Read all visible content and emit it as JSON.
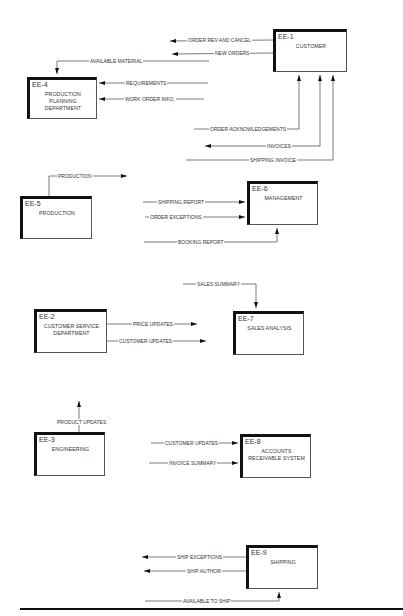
{
  "entities": [
    {
      "id": "EE-1",
      "name": "CUSTOMER"
    },
    {
      "id": "EE-2",
      "name": "CUSTOMER SERVICE DEPARTMENT"
    },
    {
      "id": "EE-3",
      "name": "ENGINEERING"
    },
    {
      "id": "EE-4",
      "name": "PRODUCTION PLANNING DEPARTMENT"
    },
    {
      "id": "EE-5",
      "name": "PRODUCTION"
    },
    {
      "id": "EE-6",
      "name": "MANAGEMENT"
    },
    {
      "id": "EE-7",
      "name": "SALES ANALYSIS"
    },
    {
      "id": "EE-8",
      "name": "ACCOUNTS RECEIVABLE SYSTEM"
    },
    {
      "id": "EE-9",
      "name": "SHIPPING"
    }
  ],
  "boxes": {
    "ee1": {
      "id": "EE-1",
      "line1": "CUSTOMER"
    },
    "ee4": {
      "id": "EE-4",
      "line1": "PRODUCTION",
      "line2": "PLANNING",
      "line3": "DEPARTMENT"
    },
    "ee5": {
      "id": "EE-5",
      "line1": "PRODUCTION"
    },
    "ee6": {
      "id": "EE-6",
      "line1": "MANAGEMENT"
    },
    "ee2": {
      "id": "EE-2",
      "line1": "CUSTOMER SERVICE",
      "line2": "DEPARTMENT"
    },
    "ee7": {
      "id": "EE-7",
      "line1": "SALES ANALYSIS"
    },
    "ee3": {
      "id": "EE-3",
      "line1": "ENGINEERING"
    },
    "ee8": {
      "id": "EE-8",
      "line1": "ACCOUNTS",
      "line2": "RECEIVABLE SYSTEM"
    },
    "ee9": {
      "id": "EE-9",
      "line1": "SHIPPING"
    }
  },
  "flows": {
    "order_rev_cancel": "ORDER REV AND CANCEL",
    "new_orders": "NEW ORDERS",
    "available_material": "AVAILABLE MATERIAL",
    "requirements": "REQUIREMENTS",
    "work_order_info": "WORK ORDER INFO.",
    "order_ack": "ORDER ACKNOWLEDGEMENTS",
    "invoices": "INVOICES",
    "shipping_invoice": "SHIPPING INVOICE",
    "production": "PRODUCTION",
    "shipping_report": "SHIPPING REPORT",
    "order_exceptions": "ORDER EXCEPTIONS",
    "booking_report": "BOOKING REPORT",
    "sales_summary": "SALES SUMMARY",
    "price_updates": "PRICE UPDATES",
    "customer_updates_out": "CUSTOMER UPDATES",
    "product_updates": "PRODUCT UPDATES",
    "customer_updates_in": "CUSTOMER UPDATES",
    "invoice_summary": "INVOICE SUMMARY",
    "ship_exceptions": "SHIP EXCEPTIONS",
    "ship_author": "SHIP AUTHOR",
    "available_to_ship": "AVAILABLE TO SHIP"
  },
  "footer": {
    "text": "DIAGRAM 4"
  }
}
